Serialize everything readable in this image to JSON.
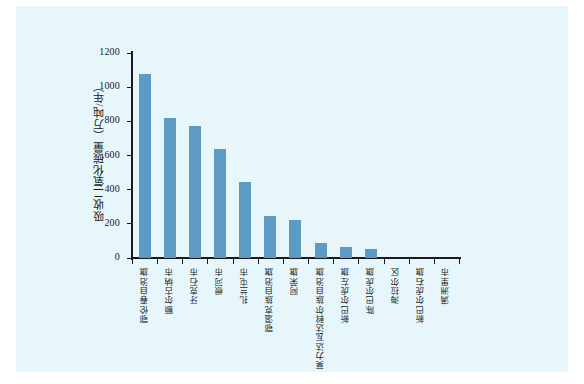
{
  "chart_data": {
    "type": "bar",
    "title": "",
    "xlabel": "",
    "ylabel": "吸收二氧化碳量（万吨/年）",
    "ylim": [
      0,
      1200
    ],
    "ytick_labels": [
      "1200",
      "1000",
      "800",
      "600",
      "400",
      "200",
      "0"
    ],
    "ytick_values": [
      1200,
      1000,
      800,
      600,
      400,
      200,
      0
    ],
    "grid": false,
    "legend": "none",
    "bar_color": "#5e9bc4",
    "background_color": "#e6f6fa",
    "axis_color": "#1a1a1a",
    "categories": [
      "鄂伦春自治旗",
      "额尔古纳市",
      "牙克石市",
      "根河市",
      "扎兰屯市",
      "鄂温克族自治旗",
      "阿荣旗",
      "莫力达瓦达斡尔族自治旗",
      "新巴尔虎左旗",
      "陈巴尔虎旗",
      "海拉尔区",
      "新巴尔虎右旗",
      "满洲里市"
    ],
    "values": [
      1080,
      818,
      775,
      638,
      445,
      248,
      220,
      85,
      62,
      50,
      0,
      0,
      0
    ]
  }
}
